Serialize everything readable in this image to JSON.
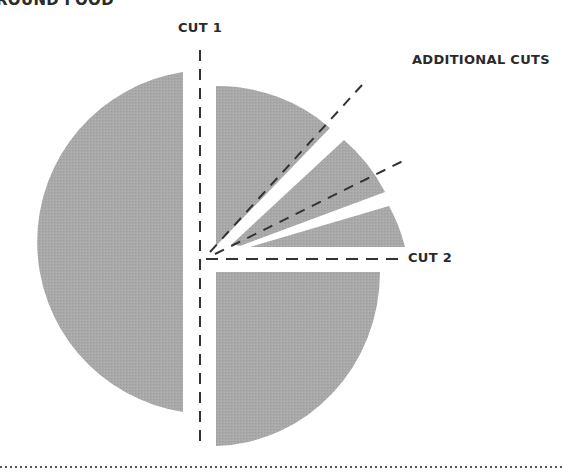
{
  "title": "ROUND FOOD",
  "labels": {
    "cut1": "CUT 1",
    "cut2": "CUT 2",
    "additional": "ADDITIONAL CUTS"
  },
  "colors": {
    "piece_fill": "#a9a9a9",
    "cut_line": "#333333",
    "text": "#2a2a2a"
  }
}
